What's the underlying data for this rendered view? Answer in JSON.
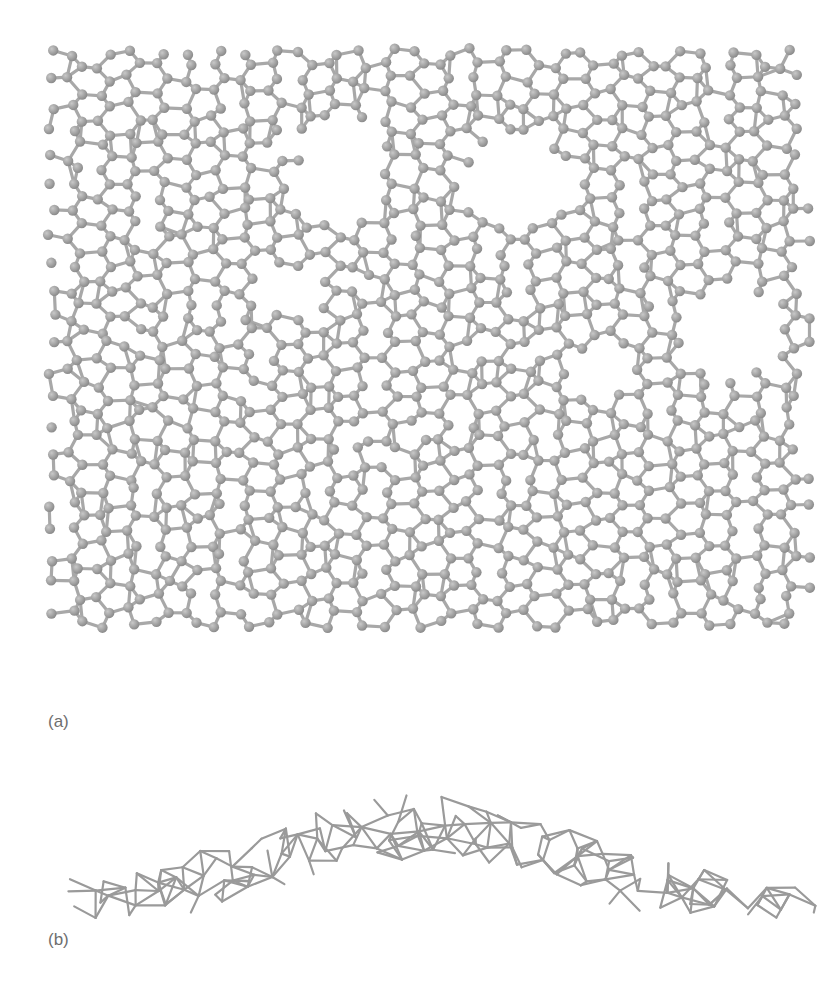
{
  "figure": {
    "panels": [
      {
        "id": "a",
        "label": "(a)",
        "view": "top view",
        "description": "Amorphous carbon network with atoms and bonds (ball-and-stick)"
      },
      {
        "id": "b",
        "label": "(b)",
        "view": "side view",
        "description": "Rippled/buckled network shown as stick model"
      }
    ],
    "colors": {
      "background": "#ffffff",
      "atom": "#8c8c8c",
      "atom_highlight": "#c8c8c8",
      "bond": "#a8a8a8",
      "side_bond": "#9a9a9a",
      "label": "#6e6e6e"
    }
  }
}
